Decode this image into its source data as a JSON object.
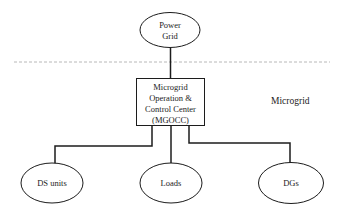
{
  "colors": {
    "stroke": "#1c1c1c",
    "text": "#1c1c1c",
    "dashed_line": "#b8b8b8",
    "node_fill": "#ffffff",
    "background": "#ffffff"
  },
  "nodes": {
    "power_grid": {
      "line1": "Power",
      "line2": "Grid"
    },
    "mgocc": {
      "line1": "Microgrid",
      "line2": "Operation &",
      "line3": "Control Center",
      "line4": "(MGOCC)"
    },
    "ds_units": {
      "label": "DS units"
    },
    "loads": {
      "label": "Loads"
    },
    "dgs": {
      "label": "DGs"
    }
  },
  "region_label": "Microgrid"
}
